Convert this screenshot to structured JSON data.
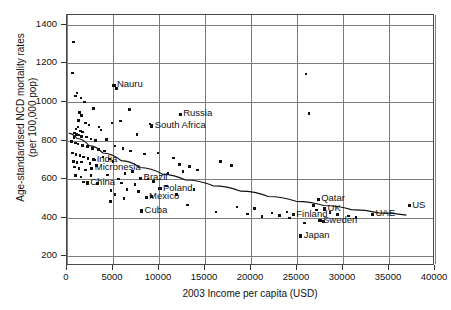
{
  "chart_data": {
    "type": "scatter",
    "title": "",
    "xlabel": "2003 Income per capita (USD)",
    "ylabel": "Age-standardised NCD mortality rates (per 100,000 pop)",
    "ylabel_line1": "Age-standardised NCD mortality rates",
    "ylabel_line2": "(per 100,000 pop)",
    "xlim": [
      0,
      40000
    ],
    "ylim": [
      150,
      1450
    ],
    "xticks": [
      0,
      5000,
      10000,
      15000,
      20000,
      25000,
      30000,
      35000,
      40000
    ],
    "xtick_labels": [
      "0",
      "5000",
      "10000",
      "15000",
      "20000",
      "25000",
      "30000",
      "35000",
      "40000"
    ],
    "yticks": [
      200,
      400,
      600,
      800,
      1000,
      1200,
      1400
    ],
    "ytick_labels": [
      "200",
      "400",
      "600",
      "800",
      "1000",
      "1200",
      "1400"
    ],
    "grid": true,
    "legend": "none",
    "marker_color": "#111111",
    "gridline_color": "#7d7d7d",
    "trendline": {
      "present": true,
      "style": "fitted curve",
      "color": "#111111",
      "points": [
        [
          300,
          832
        ],
        [
          1200,
          805
        ],
        [
          2500,
          768
        ],
        [
          4000,
          730
        ],
        [
          6000,
          690
        ],
        [
          8000,
          655
        ],
        [
          10500,
          620
        ],
        [
          13000,
          590
        ],
        [
          16000,
          560
        ],
        [
          19000,
          532
        ],
        [
          22000,
          505
        ],
        [
          25000,
          480
        ],
        [
          28000,
          458
        ],
        [
          31000,
          437
        ],
        [
          34000,
          420
        ],
        [
          37000,
          408
        ]
      ]
    },
    "labeled_points": [
      {
        "name": "Nauru",
        "x": 5100,
        "y": 1085,
        "label_dx": 4,
        "label_dy": -5
      },
      {
        "name": "Russia",
        "x": 12300,
        "y": 935,
        "label_dx": 4,
        "label_dy": -5
      },
      {
        "name": "South Africa",
        "x": 9200,
        "y": 875,
        "label_dx": 4,
        "label_dy": -5
      },
      {
        "name": "India",
        "x": 2900,
        "y": 700,
        "label_dx": 4,
        "label_dy": -5
      },
      {
        "name": "Micronesia",
        "x": 2700,
        "y": 655,
        "label_dx": 4,
        "label_dy": -5
      },
      {
        "name": "China",
        "x": 2200,
        "y": 580,
        "label_dx": 4,
        "label_dy": -5
      },
      {
        "name": "Brazil",
        "x": 8000,
        "y": 605,
        "label_dx": 4,
        "label_dy": -5
      },
      {
        "name": "Poland",
        "x": 10100,
        "y": 550,
        "label_dx": 4,
        "label_dy": -5
      },
      {
        "name": "Mexico",
        "x": 8600,
        "y": 505,
        "label_dx": 4,
        "label_dy": -5
      },
      {
        "name": "Cuba",
        "x": 8100,
        "y": 435,
        "label_dx": 4,
        "label_dy": -5
      },
      {
        "name": "Qatar",
        "x": 27300,
        "y": 495,
        "label_dx": 4,
        "label_dy": -5
      },
      {
        "name": "UK",
        "x": 28000,
        "y": 445,
        "label_dx": 4,
        "label_dy": -5
      },
      {
        "name": "Finland",
        "x": 24600,
        "y": 415,
        "label_dx": 4,
        "label_dy": -5
      },
      {
        "name": "Sweden",
        "x": 27500,
        "y": 385,
        "label_dx": 4,
        "label_dy": -5
      },
      {
        "name": "UAE",
        "x": 33200,
        "y": 418,
        "label_dx": 4,
        "label_dy": -5
      },
      {
        "name": "US",
        "x": 37200,
        "y": 462,
        "label_dx": 4,
        "label_dy": -5
      },
      {
        "name": "Japan",
        "x": 25400,
        "y": 305,
        "label_dx": 4,
        "label_dy": -5
      }
    ],
    "unlabeled_points": [
      [
        700,
        1310
      ],
      [
        600,
        1150
      ],
      [
        26000,
        1145
      ],
      [
        5400,
        1070
      ],
      [
        1100,
        1045
      ],
      [
        900,
        1030
      ],
      [
        1500,
        1020
      ],
      [
        1900,
        1000
      ],
      [
        6800,
        960
      ],
      [
        26300,
        940
      ],
      [
        1350,
        945
      ],
      [
        1600,
        930
      ],
      [
        1250,
        905
      ],
      [
        2900,
        965
      ],
      [
        2000,
        890
      ],
      [
        2400,
        880
      ],
      [
        1200,
        870
      ],
      [
        1000,
        860
      ],
      [
        1450,
        850
      ],
      [
        1700,
        845
      ],
      [
        5800,
        900
      ],
      [
        4900,
        890
      ],
      [
        3500,
        870
      ],
      [
        3700,
        855
      ],
      [
        9000,
        885
      ],
      [
        800,
        838
      ],
      [
        1050,
        832
      ],
      [
        1300,
        828
      ],
      [
        1550,
        822
      ],
      [
        750,
        815
      ],
      [
        2100,
        818
      ],
      [
        2600,
        808
      ],
      [
        3100,
        800
      ],
      [
        7600,
        830
      ],
      [
        4300,
        805
      ],
      [
        500,
        795
      ],
      [
        900,
        788
      ],
      [
        1200,
        782
      ],
      [
        1700,
        775
      ],
      [
        2200,
        768
      ],
      [
        2800,
        760
      ],
      [
        3400,
        752
      ],
      [
        4100,
        745
      ],
      [
        5200,
        772
      ],
      [
        6100,
        760
      ],
      [
        6900,
        745
      ],
      [
        600,
        735
      ],
      [
        1000,
        728
      ],
      [
        1400,
        722
      ],
      [
        1800,
        715
      ],
      [
        2300,
        708
      ],
      [
        3000,
        700
      ],
      [
        3900,
        715
      ],
      [
        4600,
        705
      ],
      [
        8400,
        730
      ],
      [
        9900,
        735
      ],
      [
        11600,
        710
      ],
      [
        700,
        690
      ],
      [
        1100,
        685
      ],
      [
        1600,
        688
      ],
      [
        2500,
        680
      ],
      [
        3200,
        672
      ],
      [
        5000,
        690
      ],
      [
        12200,
        675
      ],
      [
        13300,
        665
      ],
      [
        14200,
        648
      ],
      [
        16700,
        690
      ],
      [
        17900,
        672
      ],
      [
        800,
        662
      ],
      [
        1300,
        655
      ],
      [
        2000,
        648
      ],
      [
        6300,
        630
      ],
      [
        7100,
        640
      ],
      [
        11000,
        628
      ],
      [
        12600,
        640
      ],
      [
        900,
        620
      ],
      [
        1500,
        612
      ],
      [
        2600,
        618
      ],
      [
        4400,
        622
      ],
      [
        5600,
        600
      ],
      [
        8800,
        600
      ],
      [
        9400,
        588
      ],
      [
        1800,
        585
      ],
      [
        3300,
        578
      ],
      [
        5900,
        580
      ],
      [
        7400,
        572
      ],
      [
        10800,
        565
      ],
      [
        13800,
        545
      ],
      [
        4800,
        540
      ],
      [
        5200,
        520
      ],
      [
        6500,
        545
      ],
      [
        7800,
        535
      ],
      [
        9200,
        510
      ],
      [
        11900,
        520
      ],
      [
        13100,
        465
      ],
      [
        4700,
        485
      ],
      [
        6200,
        500
      ],
      [
        18500,
        455
      ],
      [
        20400,
        448
      ],
      [
        22300,
        425
      ],
      [
        21200,
        405
      ],
      [
        23100,
        412
      ],
      [
        23900,
        430
      ],
      [
        24200,
        398
      ],
      [
        26800,
        462
      ],
      [
        27100,
        440
      ],
      [
        28600,
        428
      ],
      [
        29400,
        418
      ],
      [
        27900,
        380
      ],
      [
        25800,
        372
      ],
      [
        30600,
        408
      ],
      [
        31400,
        400
      ],
      [
        16200,
        430
      ],
      [
        19600,
        420
      ]
    ]
  }
}
